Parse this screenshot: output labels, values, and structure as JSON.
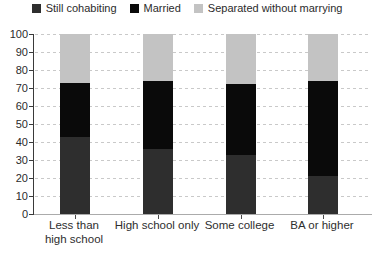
{
  "chart_data": {
    "type": "bar",
    "stacked": true,
    "title": "",
    "xlabel": "",
    "ylabel": "",
    "ylim": [
      0,
      100
    ],
    "ytick_step": 10,
    "y_ticks": [
      0,
      10,
      20,
      30,
      40,
      50,
      60,
      70,
      80,
      90,
      100
    ],
    "grid": "horizontal-dashed",
    "legend_position": "top",
    "categories": [
      "Less than high school",
      "High school only",
      "Some college",
      "BA or higher"
    ],
    "category_lines": [
      [
        "Less than",
        "high school"
      ],
      [
        "High school only"
      ],
      [
        "Some college"
      ],
      [
        "BA or higher"
      ]
    ],
    "series": [
      {
        "name": "Still cohabiting",
        "color": "#2e2e2e",
        "values": [
          43,
          36,
          33,
          21
        ]
      },
      {
        "name": "Married",
        "color": "#0a0a0a",
        "values": [
          30,
          38,
          39,
          53
        ]
      },
      {
        "name": "Separated without marrying",
        "color": "#c3c3c3",
        "values": [
          27,
          26,
          28,
          26
        ]
      }
    ],
    "colors": {
      "background": "#ffffff",
      "gridline": "#c9c9c9",
      "y_axis_line": "#3a3a3a",
      "x_axis_line": "#ababab",
      "text": "#2b2b2b"
    }
  }
}
